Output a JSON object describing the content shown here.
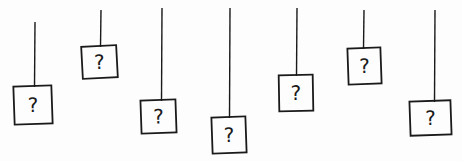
{
  "figure": {
    "stroke_color": "#1a1a1a",
    "background_color": "#fdfdfd",
    "boxes": [
      {
        "label": "?",
        "string_x": 35,
        "string_top": 22,
        "x": 14,
        "y": 86,
        "w": 38,
        "h": 38,
        "rot": -2
      },
      {
        "label": "?",
        "string_x": 101,
        "string_top": 10,
        "x": 82,
        "y": 46,
        "w": 35,
        "h": 32,
        "rot": -3
      },
      {
        "label": "?",
        "string_x": 162,
        "string_top": 8,
        "x": 141,
        "y": 100,
        "w": 35,
        "h": 33,
        "rot": -2
      },
      {
        "label": "?",
        "string_x": 230,
        "string_top": 8,
        "x": 212,
        "y": 117,
        "w": 34,
        "h": 36,
        "rot": -2
      },
      {
        "label": "?",
        "string_x": 297,
        "string_top": 8,
        "x": 279,
        "y": 75,
        "w": 34,
        "h": 36,
        "rot": -1
      },
      {
        "label": "?",
        "string_x": 364,
        "string_top": 10,
        "x": 348,
        "y": 48,
        "w": 33,
        "h": 36,
        "rot": -2
      },
      {
        "label": "?",
        "string_x": 435,
        "string_top": 10,
        "x": 410,
        "y": 101,
        "w": 41,
        "h": 34,
        "rot": -2
      }
    ]
  }
}
